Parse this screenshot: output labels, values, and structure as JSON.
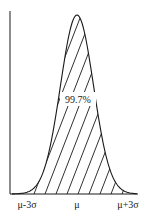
{
  "chart_data": {
    "type": "area",
    "title": "",
    "xlabel": "",
    "ylabel": "",
    "x_ticks": [
      "μ-3σ",
      "μ",
      "μ+3σ"
    ],
    "annotations": [
      {
        "text": "99.7%",
        "position": "center of shaded area"
      }
    ],
    "shaded_region": {
      "from": "μ-3σ",
      "to": "μ+3σ",
      "fill": "hatched",
      "percent": 99.7
    },
    "grid": false,
    "legend": null
  },
  "labels": {
    "left_tick": "μ-3σ",
    "center_tick": "μ",
    "right_tick": "μ+3σ",
    "area_percent": "99.7%"
  },
  "colors": {
    "line": "#1a1a1a",
    "background": "#ffffff"
  }
}
